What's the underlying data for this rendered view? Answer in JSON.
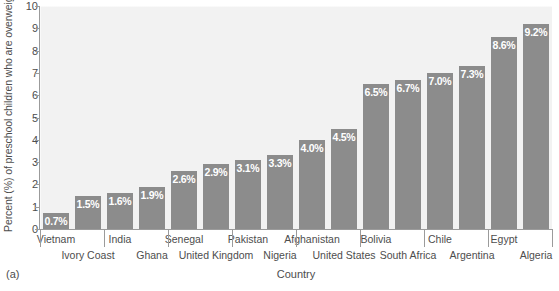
{
  "chart_data": {
    "type": "bar",
    "title": "",
    "xlabel": "Country",
    "ylabel": "Percent (%) of preschool children who are overweight",
    "ylim": [
      0,
      10
    ],
    "yticks": [
      0,
      1,
      2,
      3,
      4,
      5,
      6,
      7,
      8,
      9,
      10
    ],
    "grid": true,
    "legend": "none",
    "panel_label": "(a)",
    "bar_color": "#8c8c8c",
    "plot_background": "#f2f2f2",
    "axis_color": "#9b9b9b",
    "label_text_color": "#ffffff",
    "categories": [
      "Vietnam",
      "Ivory Coast",
      "India",
      "Ghana",
      "Senegal",
      "United Kingdom",
      "Pakistan",
      "Nigeria",
      "Afghanistan",
      "United States",
      "Bolivia",
      "South Africa",
      "Chile",
      "Argentina",
      "Egypt",
      "Algeria"
    ],
    "values": [
      0.7,
      1.5,
      1.6,
      1.9,
      2.6,
      2.9,
      3.1,
      3.3,
      4.0,
      4.5,
      6.5,
      6.7,
      7.0,
      7.3,
      8.6,
      9.2
    ],
    "data_labels": [
      "0.7%",
      "1.5%",
      "1.6%",
      "1.9%",
      "2.6%",
      "2.9%",
      "3.1%",
      "3.3%",
      "4.0%",
      "4.5%",
      "6.5%",
      "6.7%",
      "7.0%",
      "7.3%",
      "8.6%",
      "9.2%"
    ]
  }
}
